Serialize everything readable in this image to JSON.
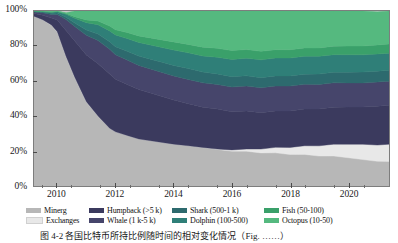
{
  "figure": {
    "caption": "图 4-2   各国比特币所持比例随时间的相对变化情况（Fig. ……）"
  },
  "axes": {
    "y": {
      "ticks": [
        "100%",
        "80%",
        "60%",
        "40%",
        "20%",
        "0%"
      ],
      "values": [
        100,
        80,
        60,
        40,
        20,
        0
      ],
      "min": 0,
      "max": 100
    },
    "x": {
      "ticks": [
        "2010",
        "2012",
        "2014",
        "2016",
        "2018",
        "2020"
      ],
      "values": [
        2010,
        2012,
        2014,
        2016,
        2018,
        2020
      ],
      "min": 2009.2,
      "max": 2021.4
    }
  },
  "legend": {
    "rows": [
      [
        {
          "label": "Minerg",
          "color": "#b7b7b7",
          "key": "miners"
        },
        {
          "label": "Humpback (>5 k)",
          "color": "#3b3a5e",
          "key": "humpback"
        },
        {
          "label": "Shark (500-1 k)",
          "color": "#2d6a6e",
          "key": "shark"
        },
        {
          "label": "Fish (50-100)",
          "color": "#3aa06a",
          "key": "fish"
        }
      ],
      [
        {
          "label": "Exchanges",
          "color": "#e8e8e8",
          "key": "exchanges"
        },
        {
          "label": "Whale (1 k-5 k)",
          "color": "#46456b",
          "key": "whale"
        },
        {
          "label": "Dolphin (100-500)",
          "color": "#2f7f78",
          "key": "dolphin"
        },
        {
          "label": "Octopus (10-50)",
          "color": "#55b97f",
          "key": "octopus"
        }
      ]
    ]
  },
  "chart_data": {
    "type": "area",
    "stacked": true,
    "normalized": true,
    "title": "",
    "xlabel": "",
    "ylabel": "",
    "xlim": [
      2009.2,
      2021.4
    ],
    "ylim": [
      0,
      100
    ],
    "grid": false,
    "legend_position": "bottom",
    "x": [
      2009.2,
      2009.5,
      2009.8,
      2010.0,
      2010.3,
      2010.6,
      2011.0,
      2011.4,
      2011.8,
      2012.0,
      2012.4,
      2012.8,
      2013.2,
      2013.6,
      2014.0,
      2014.5,
      2015.0,
      2015.5,
      2016.0,
      2016.5,
      2017.0,
      2017.5,
      2018.0,
      2018.5,
      2019.0,
      2019.5,
      2020.0,
      2020.5,
      2021.0,
      2021.4
    ],
    "series": [
      {
        "name": "Minerg",
        "color": "#b7b7b7",
        "values": [
          97,
          95,
          92,
          88,
          74,
          62,
          48,
          40,
          33,
          31,
          29,
          27,
          26,
          25,
          24,
          23,
          22,
          21,
          20,
          20,
          19,
          19,
          18,
          18,
          17,
          17,
          16,
          15,
          14,
          14
        ]
      },
      {
        "name": "Exchanges",
        "color": "#e8e8e8",
        "values": [
          0,
          0,
          0,
          0,
          0,
          0,
          0,
          0,
          0,
          0,
          0,
          0,
          0,
          0,
          0,
          0,
          0,
          0,
          0.5,
          1,
          2,
          3,
          4,
          5,
          6,
          7,
          8,
          9,
          9.5,
          10
        ]
      },
      {
        "name": "Humpback (>5 k)",
        "color": "#3b3a5e",
        "values": [
          1.5,
          2.5,
          4,
          7,
          15,
          21,
          27,
          30,
          31,
          30,
          29,
          28,
          27,
          26,
          25,
          24,
          23,
          23,
          22,
          22,
          21,
          21,
          21,
          21,
          21,
          21,
          21,
          21,
          22,
          22
        ]
      },
      {
        "name": "Whale (1 k-5 k)",
        "color": "#46456b",
        "values": [
          1,
          1.5,
          2,
          3,
          6,
          8,
          11,
          13,
          14,
          14,
          14,
          14,
          14,
          14,
          14,
          14,
          14,
          14,
          14,
          14,
          14,
          14,
          14,
          14,
          14,
          14,
          14,
          14,
          14,
          14
        ]
      },
      {
        "name": "Shark (500-1 k)",
        "color": "#2d6a6e",
        "values": [
          0.3,
          0.4,
          0.6,
          0.8,
          1.5,
          2.2,
          3.2,
          4,
          4.5,
          4.7,
          5,
          5.2,
          5.4,
          5.6,
          5.8,
          6,
          6,
          6,
          6,
          6,
          6,
          6,
          6,
          6,
          6,
          6,
          6,
          6,
          6,
          6
        ]
      },
      {
        "name": "Dolphin (100-500)",
        "color": "#2f7f78",
        "values": [
          0.2,
          0.3,
          0.6,
          0.8,
          1.6,
          2.6,
          4,
          5,
          6,
          6.5,
          7.2,
          7.8,
          8.2,
          8.6,
          9,
          9.2,
          9.4,
          9.6,
          9.8,
          10,
          10,
          10,
          10,
          10,
          10,
          10,
          10,
          10,
          10,
          10
        ]
      },
      {
        "name": "Fish (50-100)",
        "color": "#3aa06a",
        "values": [
          0,
          0.1,
          0.2,
          0.2,
          0.5,
          1,
          1.8,
          2.4,
          3,
          3.2,
          3.6,
          3.8,
          4,
          4.2,
          4.4,
          4.6,
          4.8,
          5,
          5,
          5,
          5,
          5,
          5,
          5,
          5,
          5,
          5,
          5,
          5,
          5
        ]
      },
      {
        "name": "Octopus (10-50)",
        "color": "#55b97f",
        "values": [
          0,
          0.2,
          0.6,
          0.2,
          0.4,
          3.2,
          5,
          5.6,
          8.5,
          10.6,
          12.2,
          14.2,
          15.4,
          16.6,
          17.8,
          19.2,
          20.8,
          21.4,
          22.7,
          22,
          23,
          22,
          22,
          21,
          21,
          20,
          20,
          20,
          19,
          19
        ]
      }
    ]
  }
}
